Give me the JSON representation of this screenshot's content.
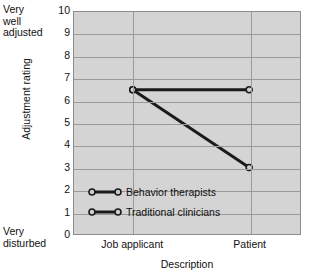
{
  "chart_data": {
    "type": "line",
    "title": "",
    "xlabel": "Description",
    "ylabel": "Adjustment rating",
    "categories": [
      "Job applicant",
      "Patient"
    ],
    "x": [
      0,
      1
    ],
    "ylim": [
      0,
      10
    ],
    "yticks": [
      "10",
      "9",
      "8",
      "7",
      "6",
      "5",
      "4",
      "3",
      "2",
      "1",
      "0"
    ],
    "grid": true,
    "legend_position": "inside-lower-left",
    "y_axis_top_annotation": "Very\nwell\nadjusted",
    "y_axis_bottom_annotation": "Very\ndisturbed",
    "series": [
      {
        "name": "Behavior therapists",
        "values": [
          6.5,
          6.5
        ],
        "color": "#1a1a1a"
      },
      {
        "name": "Traditional clinicians",
        "values": [
          6.5,
          3.0
        ],
        "color": "#1a1a1a"
      }
    ],
    "colors": {
      "plot_background": "#d4d4d4",
      "gridline": "#9a9a9a",
      "axis_border": "#8d8d8d",
      "series_line": "#1a1a1a",
      "text": "#111111"
    }
  }
}
